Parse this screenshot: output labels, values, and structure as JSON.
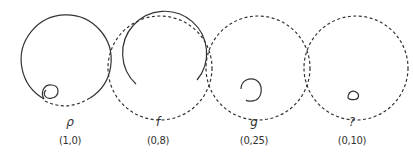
{
  "figures": [
    {
      "symbol": "ρ",
      "value": "(1,0)",
      "cx": 69
    },
    {
      "symbol": "f",
      "value": "(0,8)",
      "cx": 162
    },
    {
      "symbol": "g",
      "value": "(0,25)",
      "cx": 258
    },
    {
      "symbol": "?",
      "value": "(0,10)",
      "cx": 355
    }
  ],
  "colors": {
    "stroke": "#333333",
    "background": "#ffffff"
  }
}
